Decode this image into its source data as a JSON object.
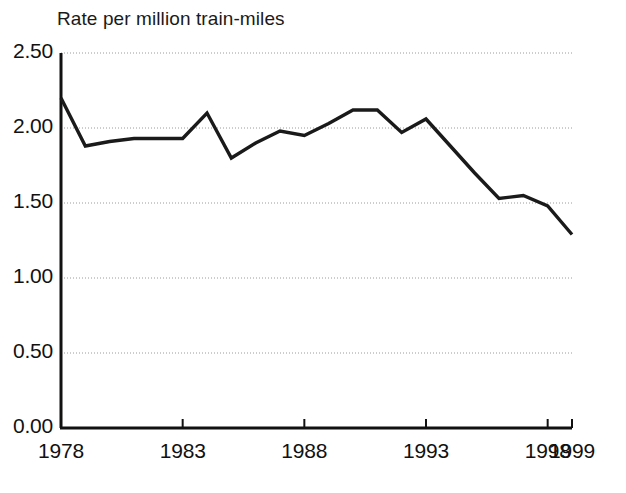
{
  "chart_data": {
    "type": "line",
    "title": "Rate per million train-miles",
    "xlabel": "",
    "ylabel": "Rate per million train-miles",
    "xlim": [
      1978,
      1999
    ],
    "ylim": [
      0.0,
      2.5
    ],
    "grid": true,
    "grid_style": "dotted-horizontal",
    "legend": "none",
    "line_color": "#1a1a1a",
    "background_color": "#ffffff",
    "y_ticks": [
      0.0,
      0.5,
      1.0,
      1.5,
      2.0,
      2.5
    ],
    "y_tick_labels": [
      "0.00",
      "0.50",
      "1.00",
      "1.50",
      "2.00",
      "2.50"
    ],
    "x_ticks": [
      1978,
      1983,
      1988,
      1993,
      1998,
      1999
    ],
    "x_tick_labels": [
      "1978",
      "1983",
      "1988",
      "1993",
      "1998",
      "1999"
    ],
    "x": [
      1978,
      1979,
      1980,
      1981,
      1982,
      1983,
      1984,
      1985,
      1986,
      1987,
      1988,
      1989,
      1990,
      1991,
      1992,
      1993,
      1994,
      1995,
      1996,
      1997,
      1998,
      1999
    ],
    "values": [
      2.2,
      1.88,
      1.91,
      1.93,
      1.93,
      1.93,
      2.1,
      1.8,
      1.9,
      1.98,
      1.95,
      2.03,
      2.12,
      2.12,
      1.97,
      2.06,
      1.88,
      1.7,
      1.53,
      1.55,
      1.48,
      1.29
    ],
    "series": [
      {
        "name": "Rate per million train-miles",
        "values": [
          2.2,
          1.88,
          1.91,
          1.93,
          1.93,
          1.93,
          2.1,
          1.8,
          1.9,
          1.98,
          1.95,
          2.03,
          2.12,
          2.12,
          1.97,
          2.06,
          1.88,
          1.7,
          1.53,
          1.55,
          1.48,
          1.29
        ]
      }
    ]
  },
  "axis": {
    "y_labels": [
      "2.50",
      "2.00",
      "1.50",
      "1.00",
      "0.50",
      "0.00"
    ],
    "x_labels": [
      "1978",
      "1983",
      "1988",
      "1993",
      "1998",
      "1999"
    ]
  }
}
